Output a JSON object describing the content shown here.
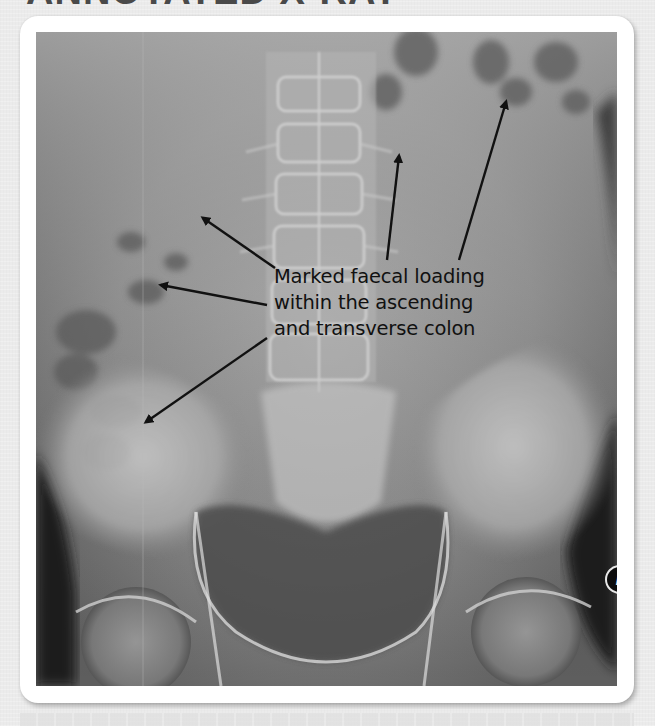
{
  "page": {
    "title": "ANNOTATED X-RAY"
  },
  "figure": {
    "annotation": {
      "lines": [
        "Marked faecal loading",
        "within the ascending",
        "and transverse colon"
      ]
    },
    "side_marker": "L",
    "arrows": [
      {
        "from": [
          275,
          268
        ],
        "to": [
          200,
          215
        ]
      },
      {
        "from": [
          267,
          305
        ],
        "to": [
          158,
          284
        ]
      },
      {
        "from": [
          267,
          338
        ],
        "to": [
          143,
          423
        ]
      },
      {
        "from": [
          387,
          260
        ],
        "to": [
          400,
          153
        ]
      },
      {
        "from": [
          459,
          260
        ],
        "to": [
          507,
          99
        ]
      }
    ],
    "colors": {
      "background": "#ebebeb",
      "card": "#ffffff",
      "annotation_text": "#111111",
      "arrow": "#111111"
    }
  }
}
